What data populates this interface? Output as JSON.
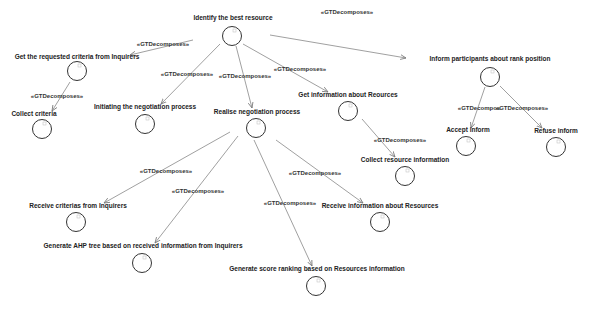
{
  "diagram": {
    "nodes": [
      {
        "id": "n0",
        "label": "Identify the best resource",
        "lx": 233,
        "ly": 18,
        "cx": 232,
        "cy": 36
      },
      {
        "id": "n1",
        "label": "Get the requested criteria from Inquirers",
        "lx": 77,
        "ly": 57,
        "cx": 77,
        "cy": 71
      },
      {
        "id": "n2",
        "label": "Collect criteria",
        "lx": 34,
        "ly": 114,
        "cx": 42,
        "cy": 129
      },
      {
        "id": "n3",
        "label": "Initiating the negotiation process",
        "lx": 145,
        "ly": 107,
        "cx": 145,
        "cy": 124
      },
      {
        "id": "n4",
        "label": "Realise negotiation process",
        "lx": 257,
        "ly": 112,
        "cx": 256,
        "cy": 128
      },
      {
        "id": "n5",
        "label": "Get information about Reources",
        "lx": 348,
        "ly": 95,
        "cx": 348,
        "cy": 111
      },
      {
        "id": "n6",
        "label": "Collect resource information",
        "lx": 405,
        "ly": 160,
        "cx": 405,
        "cy": 176
      },
      {
        "id": "n7",
        "label": "Inform participants about rank position",
        "lx": 490,
        "ly": 59,
        "cx": 490,
        "cy": 77
      },
      {
        "id": "n8",
        "label": "Accept inform",
        "lx": 468,
        "ly": 130,
        "cx": 466,
        "cy": 146
      },
      {
        "id": "n9",
        "label": "Refuse inform",
        "lx": 556,
        "ly": 131,
        "cx": 556,
        "cy": 147
      },
      {
        "id": "n10",
        "label": "Receive criterias from Inquirers",
        "lx": 78,
        "ly": 206,
        "cx": 76,
        "cy": 222
      },
      {
        "id": "n11",
        "label": "Generate AHP tree based on received information from Inquirers",
        "lx": 143,
        "ly": 246,
        "cx": 142,
        "cy": 263
      },
      {
        "id": "n12",
        "label": "Receive information about Resources",
        "lx": 380,
        "ly": 206,
        "cx": 380,
        "cy": 222
      },
      {
        "id": "n13",
        "label": "Generate score ranking based on Resources information",
        "lx": 317,
        "ly": 269,
        "cx": 316,
        "cy": 286
      }
    ],
    "edges": [
      {
        "label": "«GTDecomposes»",
        "lx": 163,
        "ly": 44,
        "x1": 193,
        "y1": 40,
        "x2": 130,
        "y2": 55
      },
      {
        "label": "«GTDecomposes»",
        "lx": 57,
        "ly": 96,
        "x1": 70,
        "y1": 82,
        "x2": 52,
        "y2": 111
      },
      {
        "label": "«GTDecomposes»",
        "lx": 187,
        "ly": 74,
        "x1": 220,
        "y1": 44,
        "x2": 161,
        "y2": 104
      },
      {
        "label": "«GTDecomposes»",
        "lx": 245,
        "ly": 76,
        "x1": 236,
        "y1": 46,
        "x2": 252,
        "y2": 108
      },
      {
        "label": "«GTDecomposes»",
        "lx": 300,
        "ly": 69,
        "x1": 243,
        "y1": 44,
        "x2": 328,
        "y2": 92
      },
      {
        "label": "«GTDecomposes»",
        "lx": 347,
        "ly": 12,
        "x1": 270,
        "y1": 35,
        "x2": 406,
        "y2": 58
      },
      {
        "label": "«GTDecomposes»",
        "lx": 400,
        "ly": 140,
        "x1": 362,
        "y1": 119,
        "x2": 395,
        "y2": 157
      },
      {
        "label": "«GTDecompos",
        "lx": 479,
        "ly": 108,
        "x1": 485,
        "y1": 87,
        "x2": 471,
        "y2": 128
      },
      {
        "label": "«GTDecomposes»",
        "lx": 522,
        "ly": 108,
        "x1": 500,
        "y1": 86,
        "x2": 542,
        "y2": 128
      },
      {
        "label": "«GTDecomposes»",
        "lx": 166,
        "ly": 171,
        "x1": 230,
        "y1": 132,
        "x2": 104,
        "y2": 203
      },
      {
        "label": "«GTDecomposes»",
        "lx": 198,
        "ly": 191,
        "x1": 238,
        "y1": 136,
        "x2": 155,
        "y2": 243
      },
      {
        "label": "«GTDecomposes»",
        "lx": 290,
        "ly": 203,
        "x1": 254,
        "y1": 140,
        "x2": 312,
        "y2": 266
      },
      {
        "label": "«GTDecomposes»",
        "lx": 315,
        "ly": 173,
        "x1": 276,
        "y1": 140,
        "x2": 363,
        "y2": 203
      }
    ]
  }
}
